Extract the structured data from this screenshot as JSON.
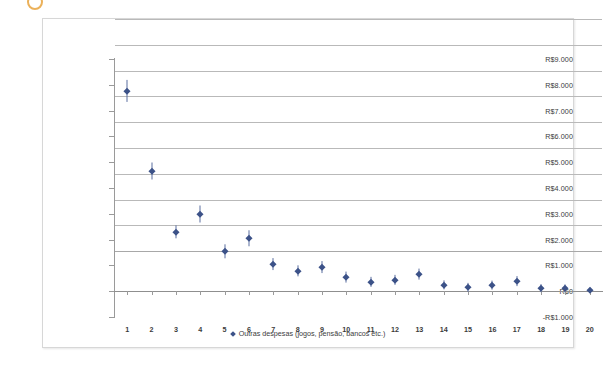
{
  "chart_data": {
    "type": "scatter",
    "title": "",
    "xlabel": "",
    "ylabel": "",
    "grid": true,
    "legend_position": "bottom",
    "legend": [
      "Outras despesas (jogos, pensão, bancos etc.)"
    ],
    "series_name": "Outras despesas (jogos, pensão, bancos etc.)",
    "marker_color": "#3c5288",
    "errorbar_color": "#5b6fa0",
    "currency_prefix": "R$",
    "x": [
      1,
      2,
      3,
      4,
      5,
      6,
      7,
      8,
      9,
      10,
      11,
      12,
      13,
      14,
      15,
      16,
      17,
      18,
      19,
      20
    ],
    "xticklabels": [
      "1",
      "2",
      "3",
      "4",
      "5",
      "6",
      "7",
      "8",
      "9",
      "10",
      "11",
      "12",
      "13",
      "14",
      "15",
      "16",
      "17",
      "18",
      "19",
      "20"
    ],
    "values": [
      7750,
      4650,
      2300,
      3000,
      1550,
      2050,
      1050,
      800,
      950,
      550,
      350,
      450,
      650,
      250,
      150,
      250,
      400,
      120,
      110,
      60
    ],
    "yerr": [
      430,
      330,
      260,
      330,
      260,
      300,
      230,
      220,
      230,
      210,
      200,
      200,
      210,
      180,
      160,
      170,
      190,
      150,
      140,
      90
    ],
    "ylim": [
      -1000,
      9000
    ],
    "ystep": 1000,
    "yticklabels": [
      "R$9.000",
      "R$8.000",
      "R$7.000",
      "R$6.000",
      "R$5.000",
      "R$4.000",
      "R$3.000",
      "R$2.000",
      "R$1.000",
      "R$0",
      "-R$1.000"
    ],
    "yticks": [
      9000,
      8000,
      7000,
      6000,
      5000,
      4000,
      3000,
      2000,
      1000,
      0,
      -1000
    ],
    "xlim": [
      0.5,
      20.5
    ]
  },
  "decor": {
    "top_glyph": "orange-circle-icon"
  }
}
